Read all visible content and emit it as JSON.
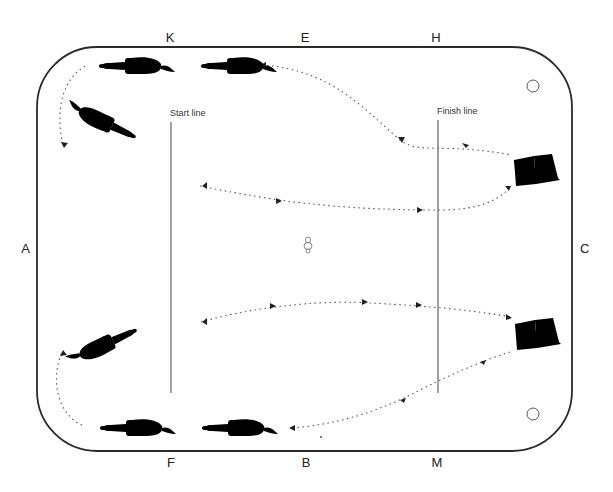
{
  "diagram": {
    "arena_letters": {
      "top": [
        "K",
        "E",
        "H"
      ],
      "bottom": [
        "F",
        "B",
        "M"
      ],
      "left": "A",
      "right": "C"
    },
    "labels": {
      "start_line": "Start line",
      "finish_line": "Finish line"
    },
    "objects": {
      "horses": 6,
      "books": 2,
      "corner_circles": 2,
      "center_marker": "small cone/marker"
    },
    "colors": {
      "line": "#2a2a2a",
      "background": "#ffffff"
    }
  }
}
